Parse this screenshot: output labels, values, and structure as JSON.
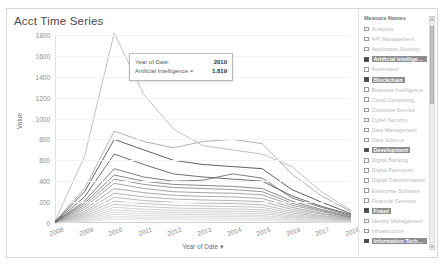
{
  "viz": {
    "title": "Acct Time Series"
  },
  "chart_data": {
    "type": "line",
    "title": "Acct Time Series",
    "xlabel": "Year of Date",
    "ylabel": "Value",
    "x": [
      2008,
      2009,
      2010,
      2011,
      2012,
      2013,
      2014,
      2015,
      2016,
      2017,
      2018
    ],
    "xtick_labels": [
      "2008",
      "2009",
      "2010",
      "2011",
      "2012",
      "2013",
      "2014",
      "2015",
      "2016",
      "2017",
      "2018"
    ],
    "ylim": [
      0,
      1800
    ],
    "ytick_labels": [
      "1800",
      "1600",
      "1400",
      "1200",
      "1000",
      "800",
      "600",
      "400",
      "200",
      "0"
    ],
    "ytick_values": [
      1800,
      1600,
      1400,
      1200,
      1000,
      800,
      600,
      400,
      200,
      0
    ],
    "grid": true,
    "legend_position": "right",
    "series": [
      {
        "name": "Artificial Intelligence",
        "color": "#b9b9b9",
        "values": [
          20,
          640,
          1819,
          1230,
          900,
          740,
          700,
          660,
          540,
          300,
          120
        ]
      },
      {
        "name": "Blockchain",
        "color": "#a8a8a8",
        "values": [
          15,
          330,
          880,
          780,
          720,
          780,
          800,
          760,
          470,
          260,
          110
        ]
      },
      {
        "name": "Development",
        "color": "#4f4f4f",
        "values": [
          12,
          300,
          800,
          700,
          600,
          560,
          540,
          520,
          320,
          200,
          90
        ]
      },
      {
        "name": "Fraud",
        "color": "#5e5e5e",
        "values": [
          10,
          250,
          660,
          560,
          470,
          440,
          420,
          400,
          260,
          160,
          80
        ]
      },
      {
        "name": "Information Technology",
        "color": "#6e6e6e",
        "values": [
          9,
          210,
          520,
          440,
          400,
          410,
          470,
          430,
          240,
          150,
          70
        ]
      },
      {
        "name": "Internet of Things",
        "color": "#7c7c7c",
        "values": [
          8,
          190,
          460,
          400,
          370,
          360,
          350,
          330,
          210,
          130,
          60
        ]
      },
      {
        "name": "Analytics",
        "color": "#8c8c8c",
        "values": [
          7,
          170,
          420,
          370,
          340,
          330,
          320,
          300,
          190,
          120,
          55
        ]
      },
      {
        "name": "API Management",
        "color": "#989898",
        "values": [
          6,
          150,
          380,
          330,
          300,
          290,
          285,
          270,
          170,
          110,
          50
        ]
      },
      {
        "name": "Automation",
        "color": "#a2a2a2",
        "values": [
          6,
          130,
          330,
          290,
          265,
          255,
          250,
          235,
          150,
          95,
          45
        ]
      },
      {
        "name": "Cloud",
        "color": "#ababab",
        "values": [
          5,
          110,
          285,
          250,
          230,
          220,
          215,
          205,
          130,
          85,
          40
        ]
      },
      {
        "name": "Cyber Security",
        "color": "#b3b3b3",
        "values": [
          5,
          95,
          245,
          215,
          198,
          190,
          185,
          175,
          112,
          72,
          34
        ]
      },
      {
        "name": "Data Science",
        "color": "#bababa",
        "values": [
          4,
          80,
          210,
          185,
          170,
          163,
          158,
          150,
          96,
          62,
          29
        ]
      },
      {
        "name": "Digital Transformation",
        "color": "#c1c1c1",
        "values": [
          4,
          68,
          178,
          157,
          144,
          138,
          134,
          127,
          81,
          53,
          25
        ]
      },
      {
        "name": "DevOps",
        "color": "#c8c8c8",
        "values": [
          3,
          57,
          150,
          132,
          121,
          116,
          113,
          107,
          68,
          44,
          21
        ]
      },
      {
        "name": "Digital Banking",
        "color": "#cecece",
        "values": [
          3,
          47,
          124,
          110,
          101,
          97,
          94,
          89,
          57,
          37,
          17
        ]
      },
      {
        "name": "Digital Payments",
        "color": "#d4d4d4",
        "values": [
          2,
          39,
          102,
          90,
          83,
          79,
          77,
          73,
          47,
          30,
          14
        ]
      },
      {
        "name": "Machine Learning",
        "color": "#d9d9d9",
        "values": [
          2,
          31,
          82,
          72,
          66,
          64,
          62,
          59,
          38,
          24,
          11
        ]
      },
      {
        "name": "Mobile",
        "color": "#dedede",
        "values": [
          2,
          24,
          64,
          56,
          52,
          50,
          48,
          46,
          29,
          19,
          9
        ]
      },
      {
        "name": "Open Banking",
        "color": "#e2e2e2",
        "values": [
          1,
          18,
          48,
          42,
          39,
          37,
          36,
          34,
          22,
          14,
          7
        ]
      },
      {
        "name": "Regtech",
        "color": "#e6e6e6",
        "values": [
          1,
          13,
          34,
          30,
          28,
          27,
          26,
          25,
          16,
          10,
          5
        ]
      }
    ]
  },
  "tooltip": {
    "rows": [
      {
        "label": "Year of Date:",
        "value": "2010"
      },
      {
        "label": "Artificial Intelligence =",
        "value": "1,819"
      }
    ]
  },
  "legend": {
    "title": "Measure Names",
    "items": [
      {
        "label": "Analytics",
        "selected": false
      },
      {
        "label": "API Management",
        "selected": false
      },
      {
        "label": "Application Security",
        "selected": false
      },
      {
        "label": "Artificial Intelligen...",
        "selected": true
      },
      {
        "label": "Automation",
        "selected": false
      },
      {
        "label": "Blockchain",
        "selected": true
      },
      {
        "label": "Business Intelligence",
        "selected": false
      },
      {
        "label": "Cloud Computing",
        "selected": false
      },
      {
        "label": "Customer Service",
        "selected": false
      },
      {
        "label": "Cyber Security",
        "selected": false
      },
      {
        "label": "Data Management",
        "selected": false
      },
      {
        "label": "Data Science",
        "selected": false
      },
      {
        "label": "Development",
        "selected": true
      },
      {
        "label": "Digital Banking",
        "selected": false
      },
      {
        "label": "Digital Payments",
        "selected": false
      },
      {
        "label": "Digital Transformation",
        "selected": false
      },
      {
        "label": "Enterprise Software",
        "selected": false
      },
      {
        "label": "Financial Services",
        "selected": false
      },
      {
        "label": "Fraud",
        "selected": true
      },
      {
        "label": "Identity Management",
        "selected": false
      },
      {
        "label": "Infrastructure",
        "selected": false
      },
      {
        "label": "Information Techno...",
        "selected": true
      },
      {
        "label": "Innovation Strategy",
        "selected": false
      },
      {
        "label": "Insurtech",
        "selected": false
      },
      {
        "label": "Internet of Things",
        "selected": true
      },
      {
        "label": "Machine Learning",
        "selected": false
      },
      {
        "label": "Mobile Banking",
        "selected": false
      },
      {
        "label": "Open Banking",
        "selected": false
      }
    ],
    "scroll_up_icon": "▴",
    "scroll_down_icon": "▾"
  }
}
